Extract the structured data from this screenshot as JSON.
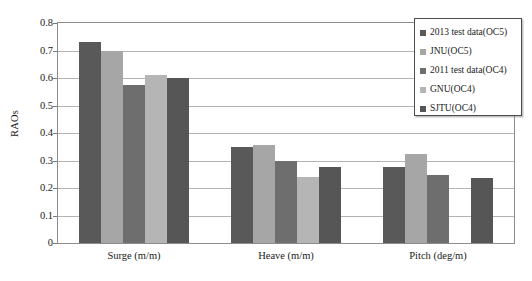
{
  "chart_data": {
    "type": "bar",
    "title": "",
    "xlabel": "",
    "ylabel": "RAOs",
    "ylim": [
      0,
      0.8
    ],
    "ytick_values": [
      0.8,
      0.7,
      0.6,
      0.5,
      0.4,
      0.3,
      0.2,
      0.1,
      0
    ],
    "ytick_labels": [
      "0.8",
      "0.7",
      "0.6",
      "0.5",
      "0.4",
      "0.3",
      "0.2",
      "0.1",
      "0"
    ],
    "grid": true,
    "legend_position": "top-right",
    "categories": [
      "Surge (m/m)",
      "Heave (m/m)",
      "Pitch (deg/m)"
    ],
    "series": [
      {
        "name": "2013 test data(OC5)",
        "color": "#595959",
        "values": [
          0.73,
          0.35,
          0.278
        ]
      },
      {
        "name": "JNU(OC5)",
        "color": "#a6a6a6",
        "values": [
          0.7,
          0.355,
          0.325
        ]
      },
      {
        "name": "2011 test data(OC4)",
        "color": "#6e6e6e",
        "values": [
          0.575,
          0.3,
          0.248
        ]
      },
      {
        "name": "GNU(OC4)",
        "color": "#b5b5b5",
        "values": [
          0.61,
          0.24,
          0
        ]
      },
      {
        "name": "SJTU(OC4)",
        "color": "#565656",
        "values": [
          0.6,
          0.277,
          0.238
        ]
      }
    ]
  },
  "axes": {
    "y_title": "RAOs"
  },
  "colors": {
    "frame": "#8c8c8c",
    "gridline": "#b3b3b3",
    "legend_border": "#4d4d4d",
    "background": "#ffffff"
  }
}
